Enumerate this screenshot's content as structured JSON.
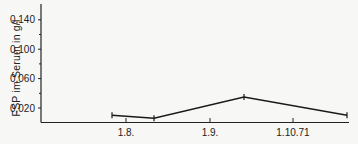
{
  "chart_data": {
    "type": "line",
    "title": "",
    "xlabel": "",
    "ylabel": "FSP im Serum in g/l",
    "x_tick_labels": [
      "1.8.",
      "1.9.",
      "1.10.71"
    ],
    "y_tick_labels": [
      "0,020",
      "0,060",
      "0,100",
      "0,140"
    ],
    "y_ticks": [
      0.02,
      0.06,
      0.1,
      0.14
    ],
    "y_minor_ticks": [
      0.04,
      0.08,
      0.12
    ],
    "ylim": [
      0,
      0.16
    ],
    "grid": false,
    "legend": null,
    "series": [
      {
        "name": "FSP",
        "x": [
          "~22.7.",
          "~12.8.",
          "~15.9.",
          "~10.10.71"
        ],
        "values": [
          0.01,
          0.006,
          0.035,
          0.01
        ]
      }
    ]
  }
}
